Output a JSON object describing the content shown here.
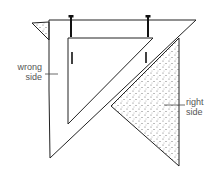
{
  "diagram": {
    "labels": {
      "wrong_side": "wrong\nside",
      "right_side": "right\nside"
    },
    "colors": {
      "line": "#222222",
      "stipple": "#555555",
      "label": "#555555"
    }
  }
}
